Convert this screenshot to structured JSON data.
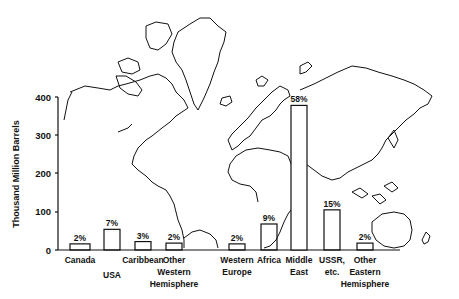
{
  "chart_data": {
    "type": "bar",
    "title": "",
    "xlabel": "",
    "ylabel": "Thousand Million Barrels",
    "ylim": [
      0,
      400
    ],
    "yticks": [
      0,
      100,
      200,
      300,
      400
    ],
    "grid": false,
    "legend": null,
    "background": "world map outline",
    "categories": [
      "Canada",
      "USA",
      "Caribbean",
      "Other Western Hemisphere",
      "Western Europe",
      "Africa",
      "Middle East",
      "USSR, etc.",
      "Other Eastern Hemisphere"
    ],
    "values": [
      16,
      54,
      22,
      18,
      16,
      68,
      378,
      105,
      18
    ],
    "annotations": [
      "2%",
      "7%",
      "3%",
      "2%",
      "2%",
      "9%",
      "58%",
      "15%",
      "2%"
    ]
  },
  "bars": [
    {
      "label_lines": [
        "Canada"
      ],
      "pct": "2%",
      "x": 70,
      "w": 20,
      "label_y": 263
    },
    {
      "label_lines": [
        "USA"
      ],
      "pct": "7%",
      "x": 104,
      "w": 16,
      "label_y": 278
    },
    {
      "label_lines": [
        "Caribbean"
      ],
      "pct": "3%",
      "x": 135,
      "w": 16,
      "label_y": 263
    },
    {
      "label_lines": [
        "Other",
        "Western",
        "Hemisphere"
      ],
      "pct": "2%",
      "x": 166,
      "w": 16,
      "label_y": 263
    },
    {
      "label_lines": [
        "Western",
        "Europe"
      ],
      "pct": "2%",
      "x": 229,
      "w": 16,
      "label_y": 263
    },
    {
      "label_lines": [
        "Africa"
      ],
      "pct": "9%",
      "x": 261,
      "w": 16,
      "label_y": 263
    },
    {
      "label_lines": [
        "Middle",
        "East"
      ],
      "pct": "58%",
      "x": 291,
      "w": 16,
      "label_y": 263
    },
    {
      "label_lines": [
        "USSR,",
        "etc."
      ],
      "pct": "15%",
      "x": 324,
      "w": 16,
      "label_y": 263
    },
    {
      "label_lines": [
        "Other",
        "Eastern",
        "Hemisphere"
      ],
      "pct": "2%",
      "x": 357,
      "w": 16,
      "label_y": 263
    }
  ],
  "axis": {
    "ylabel": "Thousand Million Barrels",
    "ticks": [
      "0",
      "100",
      "200",
      "300",
      "400"
    ]
  }
}
